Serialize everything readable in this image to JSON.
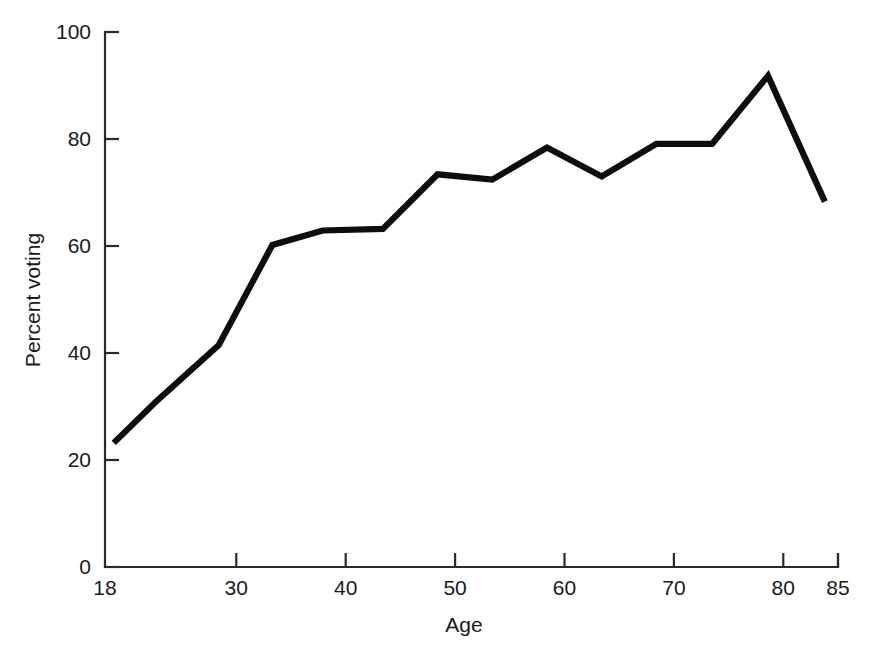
{
  "chart_data": {
    "type": "line",
    "title": "",
    "subtitle": "",
    "xlabel": "Age",
    "ylabel": "Percent voting",
    "xlim": [
      18,
      85
    ],
    "ylim": [
      0,
      100
    ],
    "grid": false,
    "legend": "none",
    "xticks": [
      18,
      30,
      40,
      50,
      60,
      70,
      80,
      85
    ],
    "xtick_labels": [
      "18",
      "30",
      "40",
      "50",
      "60",
      "70",
      "80",
      "85"
    ],
    "yticks": [
      0,
      20,
      40,
      60,
      80,
      100
    ],
    "ytick_labels": [
      "0",
      "20",
      "40",
      "60",
      "80",
      "100"
    ],
    "series": [
      {
        "name": "Percent voting",
        "color": "#0d0d0d",
        "x": [
          18.8,
          22.6,
          28.4,
          33.3,
          37.9,
          43.4,
          48.4,
          53.4,
          58.4,
          63.4,
          68.4,
          73.5,
          78.6,
          83.8
        ],
        "y": [
          23.2,
          30.8,
          41.5,
          60.2,
          62.9,
          63.2,
          73.4,
          72.4,
          78.4,
          73.0,
          79.1,
          79.1,
          91.8,
          68.3
        ]
      }
    ]
  },
  "axes": {
    "y_axis_title": "Percent voting",
    "x_axis_title": "Age"
  }
}
